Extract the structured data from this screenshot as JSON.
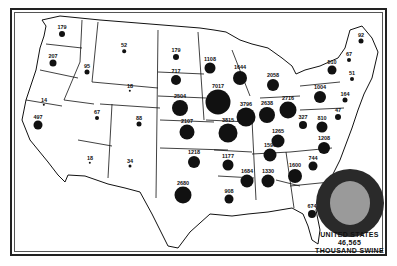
{
  "map": {
    "subject": "Swine by state (thousands)",
    "legend": {
      "line1": "UNITED STATES",
      "line2": "46,565",
      "line3": "THOUSAND SWINE"
    },
    "colors": {
      "dot": "#111111",
      "us_outer": "#2a2a2a",
      "us_inner": "#9a9a9a",
      "border": "#222222"
    },
    "states": [
      {
        "state": "Washington",
        "value": "179",
        "x": 62,
        "y": 34,
        "r": 3
      },
      {
        "state": "Oregon",
        "value": "207",
        "x": 53,
        "y": 63,
        "r": 3.5
      },
      {
        "state": "California",
        "value": "497",
        "x": 38,
        "y": 125,
        "r": 4.5
      },
      {
        "state": "Nevada",
        "value": "14",
        "x": 44,
        "y": 105,
        "r": 1.2
      },
      {
        "state": "Idaho",
        "value": "95",
        "x": 87,
        "y": 72,
        "r": 2.5
      },
      {
        "state": "Montana",
        "value": "52",
        "x": 124,
        "y": 51,
        "r": 1.8
      },
      {
        "state": "Wyoming",
        "value": "18",
        "x": 130,
        "y": 91,
        "r": 1.2
      },
      {
        "state": "Utah",
        "value": "67",
        "x": 97,
        "y": 118,
        "r": 2
      },
      {
        "state": "Colorado",
        "value": "88",
        "x": 139,
        "y": 124,
        "r": 2.5
      },
      {
        "state": "Arizona",
        "value": "18",
        "x": 90,
        "y": 163,
        "r": 1.2
      },
      {
        "state": "New Mexico",
        "value": "34",
        "x": 130,
        "y": 166,
        "r": 1.5
      },
      {
        "state": "North Dakota",
        "value": "179",
        "x": 176,
        "y": 57,
        "r": 3
      },
      {
        "state": "South Dakota",
        "value": "717",
        "x": 176,
        "y": 80,
        "r": 5
      },
      {
        "state": "Nebraska",
        "value": "2504",
        "x": 180,
        "y": 108,
        "r": 8
      },
      {
        "state": "Kansas",
        "value": "2107",
        "x": 187,
        "y": 132,
        "r": 7.5
      },
      {
        "state": "Oklahoma",
        "value": "1218",
        "x": 194,
        "y": 162,
        "r": 6
      },
      {
        "state": "Texas",
        "value": "2680",
        "x": 183,
        "y": 195,
        "r": 8.5
      },
      {
        "state": "Minnesota",
        "value": "1108",
        "x": 210,
        "y": 68,
        "r": 5.5
      },
      {
        "state": "Iowa",
        "value": "7017",
        "x": 218,
        "y": 102,
        "r": 12.5
      },
      {
        "state": "Missouri",
        "value": "3815",
        "x": 228,
        "y": 133,
        "r": 9.5
      },
      {
        "state": "Arkansas",
        "value": "1177",
        "x": 228,
        "y": 165,
        "r": 5.5
      },
      {
        "state": "Louisiana",
        "value": "908",
        "x": 229,
        "y": 199,
        "r": 4.5
      },
      {
        "state": "Wisconsin",
        "value": "1644",
        "x": 240,
        "y": 78,
        "r": 7
      },
      {
        "state": "Illinois",
        "value": "3796",
        "x": 246,
        "y": 117,
        "r": 9.5
      },
      {
        "state": "Michigan",
        "value": "2058",
        "x": 273,
        "y": 85,
        "r": 6
      },
      {
        "state": "Indiana",
        "value": "2638",
        "x": 267,
        "y": 115,
        "r": 8
      },
      {
        "state": "Ohio",
        "value": "2716",
        "x": 288,
        "y": 110,
        "r": 8.5
      },
      {
        "state": "Kentucky",
        "value": "1265",
        "x": 278,
        "y": 141,
        "r": 6.5
      },
      {
        "state": "Tennessee",
        "value": "1590",
        "x": 270,
        "y": 155,
        "r": 6.5
      },
      {
        "state": "Mississippi",
        "value": "1684",
        "x": 247,
        "y": 181,
        "r": 6.5
      },
      {
        "state": "Alabama",
        "value": "1330",
        "x": 268,
        "y": 181,
        "r": 6.5
      },
      {
        "state": "Georgia",
        "value": "1600",
        "x": 295,
        "y": 176,
        "r": 7
      },
      {
        "state": "Florida",
        "value": "674",
        "x": 312,
        "y": 214,
        "r": 4
      },
      {
        "state": "South Carolina",
        "value": "744",
        "x": 313,
        "y": 166,
        "r": 4.5
      },
      {
        "state": "North Carolina",
        "value": "1208",
        "x": 324,
        "y": 148,
        "r": 6
      },
      {
        "state": "Virginia",
        "value": "810",
        "x": 322,
        "y": 127,
        "r": 5.5
      },
      {
        "state": "West Virginia",
        "value": "327",
        "x": 303,
        "y": 125,
        "r": 4
      },
      {
        "state": "Pennsylvania",
        "value": "1004",
        "x": 320,
        "y": 97,
        "r": 6
      },
      {
        "state": "New York",
        "value": "510",
        "x": 332,
        "y": 70,
        "r": 4.5
      },
      {
        "state": "Maryland / Delaware",
        "value": "47",
        "x": 338,
        "y": 117,
        "r": 3
      },
      {
        "state": "New Jersey",
        "value": "164",
        "x": 345,
        "y": 100,
        "r": 2.5
      },
      {
        "state": "Vermont / NH",
        "value": "67",
        "x": 349,
        "y": 60,
        "r": 2
      },
      {
        "state": "Massachusetts / CT / RI",
        "value": "51",
        "x": 352,
        "y": 79,
        "r": 2
      },
      {
        "state": "Maine",
        "value": "92",
        "x": 361,
        "y": 41,
        "r": 2.5
      }
    ]
  }
}
